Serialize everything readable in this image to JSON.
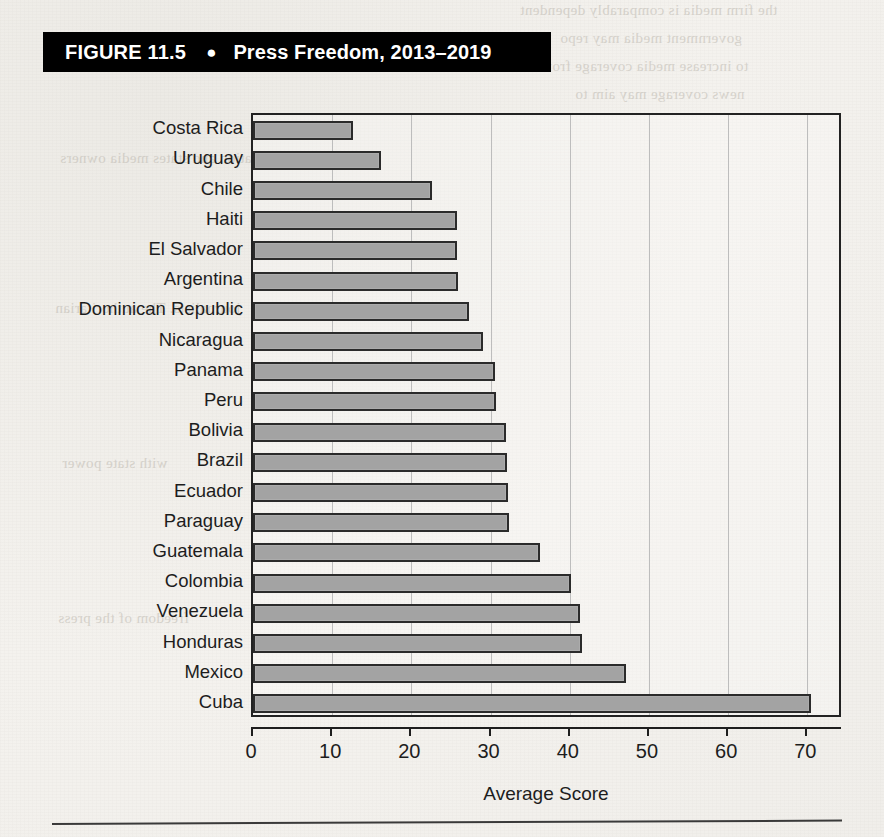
{
  "figure": {
    "number_label": "FIGURE 11.5",
    "bullet": "●",
    "title": "Press Freedom, 2013–2019"
  },
  "colors": {
    "banner_background": "#000000",
    "banner_text": "#ffffff",
    "bar_fill": "#a3a3a3",
    "bar_border": "#2b2b2b",
    "gridline": "#bdbdbd",
    "axis": "#1e1e1e",
    "page_background": "#f2f0ec"
  },
  "background_bleed_text": [
    "the firm media is comparably dependent",
    "government media may repo",
    "to increase media coverage from",
    "news coverage may aim to",
    "nation and states media owners",
    "journalists. The authoritarian",
    "with state power",
    "freedom of the press"
  ],
  "chart_data": {
    "type": "bar",
    "orientation": "horizontal",
    "title": "Press Freedom, 2013–2019",
    "xlabel": "Average Score",
    "ylabel": "",
    "xlim": [
      0,
      74.5
    ],
    "xticks": [
      0,
      10,
      20,
      30,
      40,
      50,
      60,
      70
    ],
    "grid": true,
    "legend": false,
    "categories": [
      "Costa Rica",
      "Uruguay",
      "Chile",
      "Haiti",
      "El Salvador",
      "Argentina",
      "Dominican Republic",
      "Nicaragua",
      "Panama",
      "Peru",
      "Bolivia",
      "Brazil",
      "Ecuador",
      "Paraguay",
      "Guatemala",
      "Colombia",
      "Venezuela",
      "Honduras",
      "Mexico",
      "Cuba"
    ],
    "values": [
      12.6,
      16.2,
      22.6,
      25.7,
      25.8,
      25.9,
      27.3,
      29.1,
      30.6,
      30.7,
      32.0,
      32.1,
      32.2,
      32.3,
      36.2,
      40.2,
      41.3,
      41.6,
      47.1,
      70.4
    ]
  }
}
